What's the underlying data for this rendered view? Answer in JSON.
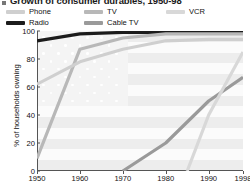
{
  "title": "Growth of consumer durables, 1950-98",
  "legend": {
    "position": "top",
    "items": [
      {
        "label": "Phone",
        "color": "#cfcfcf",
        "x": 0,
        "y": 0
      },
      {
        "label": "TV",
        "color": "#b8b8b8",
        "x": 78,
        "y": 0
      },
      {
        "label": "VCR",
        "color": "#d8d8d8",
        "x": 160,
        "y": 0
      },
      {
        "label": "Radio",
        "color": "#1c1c1c",
        "x": 0,
        "y": 11
      },
      {
        "label": "Cable TV",
        "color": "#9a9a9a",
        "x": 78,
        "y": 11
      }
    ]
  },
  "chart_data": {
    "type": "line",
    "title": "Growth of consumer durables, 1950-98",
    "xlabel": "",
    "ylabel": "% of households owning",
    "xlim": [
      1950,
      1998
    ],
    "ylim": [
      0,
      100
    ],
    "grid": false,
    "background": "us-flag-watermark",
    "x_ticks": [
      1950,
      1960,
      1970,
      1980,
      1990,
      1998
    ],
    "y_ticks": [
      0,
      20,
      40,
      60,
      80,
      100
    ],
    "series": [
      {
        "name": "Radio",
        "color": "#1c1c1c",
        "width": 3.2,
        "points": [
          [
            1950,
            93
          ],
          [
            1960,
            98
          ],
          [
            1970,
            99
          ],
          [
            1980,
            99
          ],
          [
            1990,
            99
          ],
          [
            1998,
            99
          ]
        ]
      },
      {
        "name": "TV",
        "color": "#b8b8b8",
        "width": 3.2,
        "points": [
          [
            1950,
            9
          ],
          [
            1960,
            87
          ],
          [
            1970,
            95
          ],
          [
            1980,
            98
          ],
          [
            1990,
            98
          ],
          [
            1998,
            98
          ]
        ]
      },
      {
        "name": "Phone",
        "color": "#cfcfcf",
        "width": 3.2,
        "points": [
          [
            1950,
            62
          ],
          [
            1960,
            78
          ],
          [
            1970,
            87
          ],
          [
            1980,
            93
          ],
          [
            1990,
            94
          ],
          [
            1998,
            94
          ]
        ]
      },
      {
        "name": "Cable TV",
        "color": "#9a9a9a",
        "width": 3.2,
        "points": [
          [
            1970,
            0
          ],
          [
            1980,
            20
          ],
          [
            1990,
            50
          ],
          [
            1998,
            67
          ]
        ]
      },
      {
        "name": "VCR",
        "color": "#d8d8d8",
        "width": 3.2,
        "points": [
          [
            1985,
            0
          ],
          [
            1990,
            40
          ],
          [
            1998,
            85
          ]
        ]
      }
    ]
  }
}
